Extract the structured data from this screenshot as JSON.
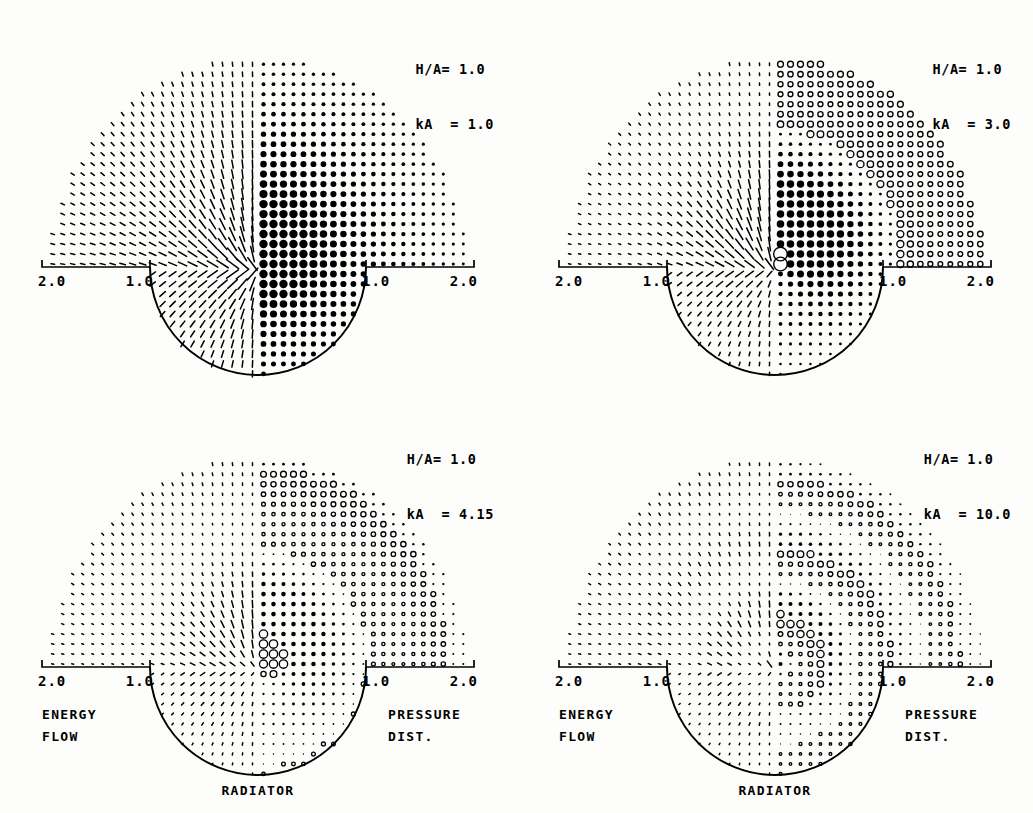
{
  "figure": {
    "background_color": "#fdfdfc",
    "ink_color": "#000000"
  },
  "panels": [
    {
      "id": "panel-top-left",
      "params": {
        "ha_label": "H/A=",
        "ha_value": "1.0",
        "ka_label": "kA  =",
        "ka_value": "1.0"
      },
      "axis": {
        "ticks": [
          "2.0",
          "1.0",
          "1.0",
          "2.0"
        ]
      },
      "annotations": {
        "left": [
          "",
          ""
        ],
        "right": [
          "",
          ""
        ],
        "bottom": ""
      },
      "field": {
        "ka": 1.0,
        "ha": 1.0,
        "dot_scale": 1.0,
        "flow_scale": 1.0,
        "density": 26
      }
    },
    {
      "id": "panel-top-right",
      "params": {
        "ha_label": "H/A=",
        "ha_value": "1.0",
        "ka_label": "kA  =",
        "ka_value": "3.0"
      },
      "axis": {
        "ticks": [
          "2.0",
          "1.0",
          "1.0",
          "2.0"
        ]
      },
      "annotations": {
        "left": [
          "",
          ""
        ],
        "right": [
          "",
          ""
        ],
        "bottom": ""
      },
      "field": {
        "ka": 3.0,
        "ha": 1.0,
        "dot_scale": 0.9,
        "flow_scale": 0.85,
        "density": 26
      }
    },
    {
      "id": "panel-bottom-left",
      "params": {
        "ha_label": "H/A=",
        "ha_value": "1.0",
        "ka_label": "kA  =",
        "ka_value": "4.15"
      },
      "axis": {
        "ticks": [
          "2.0",
          "1.0",
          "1.0",
          "2.0"
        ]
      },
      "annotations": {
        "left": [
          "ENERGY",
          "FLOW"
        ],
        "right": [
          "PRESSURE",
          "DIST."
        ],
        "bottom": "RADIATOR"
      },
      "field": {
        "ka": 4.15,
        "ha": 1.0,
        "dot_scale": 0.55,
        "flow_scale": 0.5,
        "density": 26
      }
    },
    {
      "id": "panel-bottom-right",
      "params": {
        "ha_label": "H/A=",
        "ha_value": "1.0",
        "ka_label": "kA  =",
        "ka_value": "10.0"
      },
      "axis": {
        "ticks": [
          "2.0",
          "1.0",
          "1.0",
          "2.0"
        ]
      },
      "annotations": {
        "left": [
          "ENERGY",
          "FLOW"
        ],
        "right": [
          "PRESSURE",
          "DIST."
        ],
        "bottom": "RADIATOR"
      },
      "field": {
        "ka": 10.0,
        "ha": 1.0,
        "dot_scale": 0.48,
        "flow_scale": 0.42,
        "density": 26
      }
    }
  ],
  "chart_data": {
    "type": "scatter",
    "subplots": 4,
    "grid": false,
    "legend_position": "none",
    "xlabel": "",
    "ylabel": "",
    "xlim": [
      -2.0,
      2.0
    ],
    "ylim": [
      -1.0,
      2.0
    ],
    "xticks": [
      -2.0,
      -1.0,
      1.0,
      2.0
    ],
    "xticklabels": [
      "2.0",
      "1.0",
      "1.0",
      "2.0"
    ],
    "annotations": [
      "ENERGY FLOW",
      "PRESSURE DIST.",
      "RADIATOR"
    ],
    "series": [
      {
        "name": "H/A= 1.0, kA = 1.0",
        "ha": 1.0,
        "ka": 1.0,
        "half_left": "energy-flow-vectors",
        "half_right": "pressure-magnitude-dots"
      },
      {
        "name": "H/A= 1.0, kA = 3.0",
        "ha": 1.0,
        "ka": 3.0,
        "half_left": "energy-flow-vectors",
        "half_right": "pressure-magnitude-dots"
      },
      {
        "name": "H/A= 1.0, kA = 4.15",
        "ha": 1.0,
        "ka": 4.15,
        "half_left": "energy-flow-vectors",
        "half_right": "pressure-magnitude-dots"
      },
      {
        "name": "H/A= 1.0, kA =10.0",
        "ha": 1.0,
        "ka": 10.0,
        "half_left": "energy-flow-vectors",
        "half_right": "pressure-magnitude-dots"
      }
    ],
    "geometry": {
      "radiator_shape": "semicircle",
      "radiator_radius": 1.0,
      "radiator_position": "below baseline, centered at origin",
      "baseline_y": 0.0
    }
  }
}
